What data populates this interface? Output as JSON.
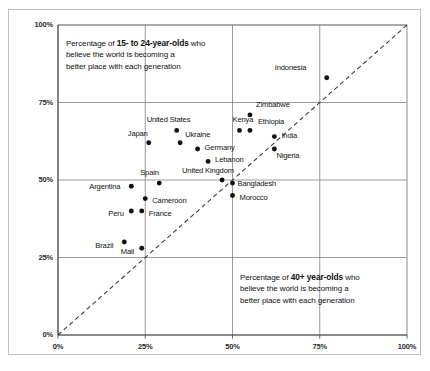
{
  "chart_data": {
    "type": "scatter",
    "title": "",
    "xlabel": "Percentage of 40+ year-olds who believe the world is becoming a better place with each generation",
    "ylabel": "Percentage of 15- to 24-year-olds who believe the world is becoming a better place with each generation",
    "xlim": [
      0,
      100
    ],
    "ylim": [
      0,
      100
    ],
    "grid": true,
    "legend": "none",
    "xticks": [
      "0%",
      "25%",
      "50%",
      "75%",
      "100%"
    ],
    "yticks": [
      "0%",
      "25%",
      "50%",
      "75%",
      "100%"
    ],
    "xtick_values": [
      0,
      25,
      50,
      75,
      100
    ],
    "ytick_values": [
      0,
      25,
      50,
      75,
      100
    ],
    "reference_line": {
      "type": "diagonal",
      "style": "dashed",
      "from": [
        0,
        0
      ],
      "to": [
        100,
        100
      ],
      "color": "#333333"
    },
    "points": [
      {
        "label": "Indonesia",
        "x": 77,
        "y": 83,
        "label_dx": -52,
        "label_dy": -11
      },
      {
        "label": "Zimbabwe",
        "x": 55,
        "y": 71,
        "label_dx": 6,
        "label_dy": -11
      },
      {
        "label": "Kenya",
        "x": 52,
        "y": 66,
        "label_dx": -7,
        "label_dy": -11
      },
      {
        "label": "Ethiopia",
        "x": 55,
        "y": 66,
        "label_dx": 8,
        "label_dy": -9
      },
      {
        "label": "India",
        "x": 62,
        "y": 64,
        "label_dx": 7,
        "label_dy": -2
      },
      {
        "label": "Nigeria",
        "x": 62,
        "y": 60,
        "label_dx": 2,
        "label_dy": 6
      },
      {
        "label": "United States",
        "x": 34,
        "y": 66,
        "label_dx": -30,
        "label_dy": -11
      },
      {
        "label": "Japan",
        "x": 26,
        "y": 62,
        "label_dx": -21,
        "label_dy": -10
      },
      {
        "label": "Ukraine",
        "x": 35,
        "y": 62,
        "label_dx": 5,
        "label_dy": -9
      },
      {
        "label": "Germany",
        "x": 40,
        "y": 60,
        "label_dx": 7,
        "label_dy": -2
      },
      {
        "label": "Lebanon",
        "x": 43,
        "y": 56,
        "label_dx": 7,
        "label_dy": -2
      },
      {
        "label": "United Kingdom",
        "x": 47,
        "y": 50,
        "label_dx": -40,
        "label_dy": -10
      },
      {
        "label": "Bangladesh",
        "x": 50,
        "y": 49,
        "label_dx": 5,
        "label_dy": 0
      },
      {
        "label": "Morocco",
        "x": 50,
        "y": 45,
        "label_dx": 7,
        "label_dy": 1
      },
      {
        "label": "Spain",
        "x": 29,
        "y": 49,
        "label_dx": -19,
        "label_dy": -11
      },
      {
        "label": "Cameroon",
        "x": 25,
        "y": 44,
        "label_dx": 7,
        "label_dy": 1
      },
      {
        "label": "France",
        "x": 24,
        "y": 40,
        "label_dx": 7,
        "label_dy": 2
      },
      {
        "label": "Peru",
        "x": 21,
        "y": 40,
        "label_dx": -23,
        "label_dy": 2
      },
      {
        "label": "Argentina",
        "x": 21,
        "y": 48,
        "label_dx": -42,
        "label_dy": 0
      },
      {
        "label": "Brazil",
        "x": 19,
        "y": 30,
        "label_dx": -29,
        "label_dy": 3
      },
      {
        "label": "Mali",
        "x": 24,
        "y": 28,
        "label_dx": -21,
        "label_dy": 3
      }
    ]
  },
  "annotations": {
    "top_left": {
      "line1_prefix": "Percentage of ",
      "line1_bold": "15- to 24-year-olds",
      "line1_suffix": " who",
      "line2": "believe the world is becoming a",
      "line3": "better place with each generation"
    },
    "bottom_right": {
      "line1_prefix": "Percentage of ",
      "line1_bold": "40+ year-olds",
      "line1_suffix": " who",
      "line2": "believe the world is becoming a",
      "line3": "better place with each generation"
    }
  },
  "colors": {
    "point": "#111111",
    "grid": "#808080",
    "axis": "#4d4d4d",
    "frame": "#bfbfbf",
    "diagonal": "#333333",
    "background": "#ffffff"
  }
}
